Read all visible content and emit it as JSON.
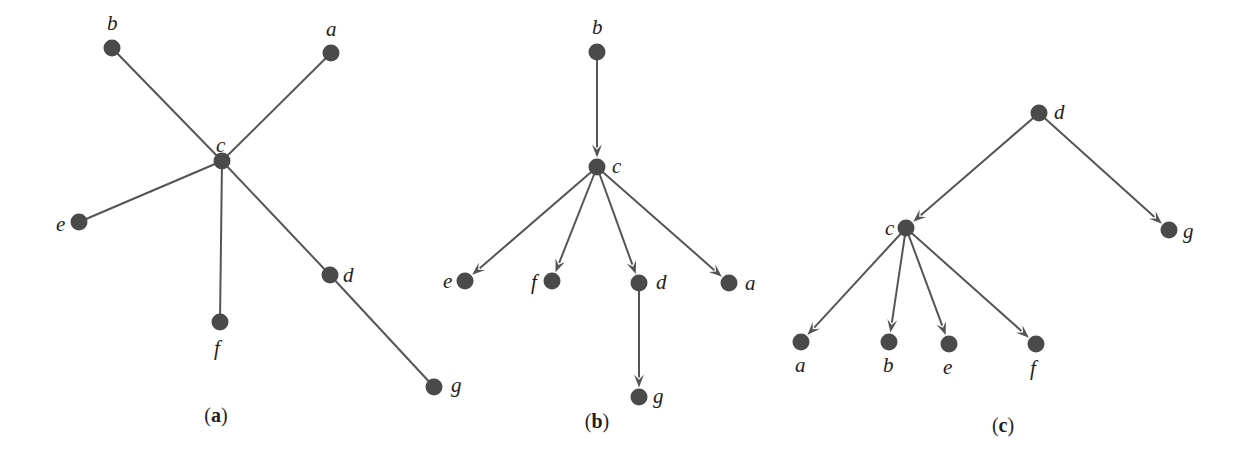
{
  "colors": {
    "node": "#4a4a4a",
    "edge": "#555555",
    "text": "#1e1e1e",
    "background": "#ffffff"
  },
  "panels": [
    {
      "id": "a",
      "caption": "a",
      "caption_pos": [
        216,
        422
      ],
      "directed": false,
      "nodes": [
        {
          "id": "b",
          "x": 112,
          "y": 48,
          "label": "b",
          "lx": 107,
          "ly": 30
        },
        {
          "id": "a",
          "x": 331,
          "y": 53,
          "label": "a",
          "lx": 326,
          "ly": 36
        },
        {
          "id": "c",
          "x": 222,
          "y": 161,
          "label": "c",
          "lx": 216,
          "ly": 152
        },
        {
          "id": "e",
          "x": 79,
          "y": 222,
          "label": "e",
          "lx": 56,
          "ly": 231
        },
        {
          "id": "f",
          "x": 220,
          "y": 322,
          "label": "f",
          "lx": 214,
          "ly": 355
        },
        {
          "id": "d",
          "x": 330,
          "y": 275,
          "label": "d",
          "lx": 343,
          "ly": 282
        },
        {
          "id": "g",
          "x": 434,
          "y": 387,
          "label": "g",
          "lx": 451,
          "ly": 392
        }
      ],
      "edges": [
        [
          "c",
          "b"
        ],
        [
          "c",
          "a"
        ],
        [
          "c",
          "e"
        ],
        [
          "c",
          "f"
        ],
        [
          "c",
          "d"
        ],
        [
          "d",
          "g"
        ]
      ]
    },
    {
      "id": "b",
      "caption": "b",
      "caption_pos": [
        597,
        428
      ],
      "directed": true,
      "nodes": [
        {
          "id": "b",
          "x": 597,
          "y": 52,
          "label": "b",
          "lx": 592,
          "ly": 34
        },
        {
          "id": "c",
          "x": 597,
          "y": 167,
          "label": "c",
          "lx": 612,
          "ly": 173
        },
        {
          "id": "e",
          "x": 465,
          "y": 281,
          "label": "e",
          "lx": 443,
          "ly": 288
        },
        {
          "id": "f",
          "x": 552,
          "y": 281,
          "label": "f",
          "lx": 531,
          "ly": 289
        },
        {
          "id": "d",
          "x": 639,
          "y": 283,
          "label": "d",
          "lx": 656,
          "ly": 289
        },
        {
          "id": "a",
          "x": 729,
          "y": 283,
          "label": "a",
          "lx": 745,
          "ly": 290
        },
        {
          "id": "g",
          "x": 639,
          "y": 397,
          "label": "g",
          "lx": 653,
          "ly": 403
        }
      ],
      "edges": [
        [
          "b",
          "c"
        ],
        [
          "c",
          "e"
        ],
        [
          "c",
          "f"
        ],
        [
          "c",
          "d"
        ],
        [
          "c",
          "a"
        ],
        [
          "d",
          "g"
        ]
      ]
    },
    {
      "id": "c",
      "caption": "c",
      "caption_pos": [
        1003,
        432
      ],
      "directed": true,
      "nodes": [
        {
          "id": "d",
          "x": 1039,
          "y": 113,
          "label": "d",
          "lx": 1054,
          "ly": 119
        },
        {
          "id": "c",
          "x": 906,
          "y": 228,
          "label": "c",
          "lx": 885,
          "ly": 235
        },
        {
          "id": "g",
          "x": 1169,
          "y": 230,
          "label": "g",
          "lx": 1183,
          "ly": 238
        },
        {
          "id": "a",
          "x": 801,
          "y": 342,
          "label": "a",
          "lx": 795,
          "ly": 372
        },
        {
          "id": "b",
          "x": 889,
          "y": 342,
          "label": "b",
          "lx": 883,
          "ly": 372
        },
        {
          "id": "e",
          "x": 949,
          "y": 344,
          "label": "e",
          "lx": 943,
          "ly": 374
        },
        {
          "id": "f",
          "x": 1036,
          "y": 344,
          "label": "f",
          "lx": 1030,
          "ly": 375
        }
      ],
      "edges": [
        [
          "d",
          "c"
        ],
        [
          "d",
          "g"
        ],
        [
          "c",
          "a"
        ],
        [
          "c",
          "b"
        ],
        [
          "c",
          "e"
        ],
        [
          "c",
          "f"
        ]
      ]
    }
  ],
  "geometry": {
    "node_radius": 8.5,
    "edge_width": 2,
    "arrow_length": 13,
    "arrow_half_width": 5
  }
}
